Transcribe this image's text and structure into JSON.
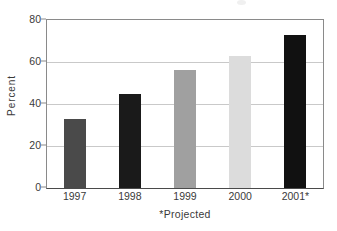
{
  "chart_data": {
    "type": "bar",
    "title": "",
    "subtitle": "",
    "xlabel": "*Projected",
    "ylabel": "Percent",
    "categories": [
      "1997",
      "1998",
      "1999",
      "2000",
      "2001*"
    ],
    "values": [
      33,
      45,
      56,
      63,
      73
    ],
    "series": [
      {
        "name": "Percent",
        "values": [
          33,
          45,
          56,
          63,
          73
        ]
      }
    ],
    "bar_colors": [
      "#4a4a4a",
      "#1a1a1a",
      "#a0a0a0",
      "#dcdcdc",
      "#111111"
    ],
    "ylim": [
      0,
      80
    ],
    "yticks": [
      0,
      20,
      40,
      60,
      80
    ],
    "ytick_labels": [
      "0",
      "20",
      "40",
      "60",
      "80"
    ],
    "grid": true,
    "grid_axis": "y",
    "legend": false,
    "legend_position": "none",
    "annotations": [
      "*Projected"
    ]
  },
  "axes": {
    "y_title": "Percent",
    "x_caption": "*Projected"
  },
  "colors": {
    "axis": "#8a8a8a",
    "gridline": "#c9c9c9",
    "text": "#3a3a3a",
    "background": "#ffffff"
  }
}
